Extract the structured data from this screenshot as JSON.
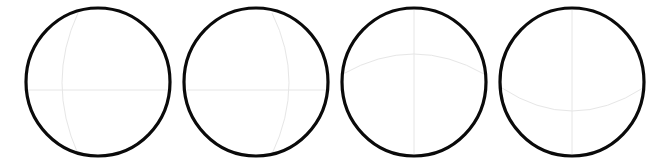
{
  "canvas": {
    "width": 665,
    "height": 166,
    "background": "#ffffff"
  },
  "style": {
    "outline_color": "#0a0a0a",
    "outline_width": 3.2,
    "guide_color": "#e6e6e6",
    "guide_width": 1
  },
  "spheres": [
    {
      "id": "sphere-1",
      "cx": 98,
      "cy": 82,
      "rx": 72,
      "ry": 74,
      "guides": [
        {
          "kind": "horizontal-line",
          "d": "M 28 90 L 168 90"
        },
        {
          "kind": "vertical-arc",
          "d": "M 78 13 Q 46 82 78 154"
        }
      ]
    },
    {
      "id": "sphere-2",
      "cx": 256,
      "cy": 82,
      "rx": 72,
      "ry": 74,
      "guides": [
        {
          "kind": "horizontal-line",
          "d": "M 187 90 L 326 90"
        },
        {
          "kind": "vertical-arc",
          "d": "M 272 13 Q 306 82 272 154"
        }
      ]
    },
    {
      "id": "sphere-3",
      "cx": 414,
      "cy": 82,
      "rx": 72,
      "ry": 74,
      "guides": [
        {
          "kind": "vertical-line",
          "d": "M 414 10 L 414 154"
        },
        {
          "kind": "horizontal-arc",
          "d": "M 343 74 Q 414 34 484 74"
        }
      ]
    },
    {
      "id": "sphere-4",
      "cx": 572,
      "cy": 82,
      "rx": 72,
      "ry": 74,
      "guides": [
        {
          "kind": "vertical-line",
          "d": "M 572 10 L 572 154"
        },
        {
          "kind": "horizontal-arc",
          "d": "M 502 88 Q 572 134 643 88"
        }
      ]
    }
  ]
}
